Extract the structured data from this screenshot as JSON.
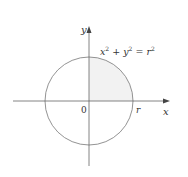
{
  "diagram": {
    "equation": {
      "x": "x",
      "sup1": "2",
      "plus": " + ",
      "y": "y",
      "sup2": "2",
      "eq": " = ",
      "r": "r",
      "sup3": "2"
    },
    "axis_x_label": "x",
    "axis_y_label": "y",
    "origin_label": "0",
    "radius_label": "r",
    "colors": {
      "stroke": "#666666",
      "shade": "#f2f2f2",
      "text": "#333333"
    }
  }
}
